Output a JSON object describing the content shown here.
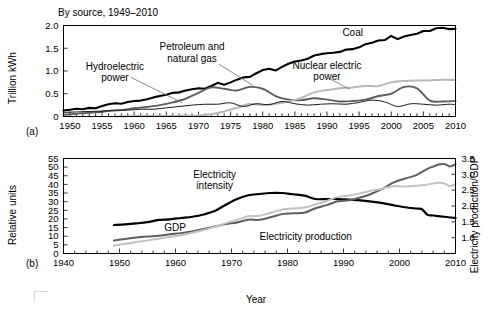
{
  "figure": {
    "panel_a_tag": "(a)",
    "panel_b_tag": "(b)"
  },
  "chart_data": [
    {
      "type": "line",
      "panel": "(a)",
      "title": "By source, 1949–2010",
      "xlabel": "",
      "ylabel": "Trillion kWh",
      "xlim": [
        1949,
        2010
      ],
      "ylim": [
        0,
        2.0
      ],
      "yticks": [
        "0",
        "0.5",
        "1.0",
        "1.5",
        "2.0"
      ],
      "ytick_values": [
        0,
        0.5,
        1.0,
        1.5,
        2.0
      ],
      "xticks": [
        "1950",
        "1955",
        "1960",
        "1965",
        "1970",
        "1975",
        "1980",
        "1985",
        "1990",
        "1995",
        "2000",
        "2005",
        "2010"
      ],
      "xtick_values": [
        1950,
        1955,
        1960,
        1965,
        1970,
        1975,
        1980,
        1985,
        1990,
        1995,
        2000,
        2005,
        2010
      ],
      "minor_tick_step": 1,
      "grid": false,
      "legend": "inline-annotations",
      "annotations": [
        {
          "text": "Coal",
          "x": 1994,
          "y": 1.78
        },
        {
          "text": "Petroleum and\nnatural gas",
          "x": 1969,
          "y": 1.46
        },
        {
          "text": "Hydroelectric\npower",
          "x": 1957,
          "y": 1.03
        },
        {
          "text": "Nuclear electric\npower",
          "x": 1990,
          "y": 1.05
        }
      ],
      "series": [
        {
          "name": "Coal",
          "color": "#000000",
          "width": 2.1,
          "x": [
            1949,
            1950,
            1951,
            1952,
            1953,
            1954,
            1955,
            1956,
            1957,
            1958,
            1959,
            1960,
            1961,
            1962,
            1963,
            1964,
            1965,
            1966,
            1967,
            1968,
            1969,
            1970,
            1971,
            1972,
            1973,
            1974,
            1975,
            1976,
            1977,
            1978,
            1979,
            1980,
            1981,
            1982,
            1983,
            1984,
            1985,
            1986,
            1987,
            1988,
            1989,
            1990,
            1991,
            1992,
            1993,
            1994,
            1995,
            1996,
            1997,
            1998,
            1999,
            2000,
            2001,
            2002,
            2003,
            2004,
            2005,
            2006,
            2007,
            2008,
            2009,
            2010
          ],
          "y": [
            0.13,
            0.15,
            0.17,
            0.16,
            0.19,
            0.18,
            0.23,
            0.27,
            0.29,
            0.28,
            0.32,
            0.34,
            0.35,
            0.38,
            0.42,
            0.45,
            0.48,
            0.52,
            0.53,
            0.57,
            0.6,
            0.62,
            0.61,
            0.67,
            0.74,
            0.7,
            0.75,
            0.81,
            0.86,
            0.87,
            0.95,
            1.02,
            1.05,
            1.01,
            1.09,
            1.16,
            1.21,
            1.23,
            1.27,
            1.34,
            1.37,
            1.39,
            1.4,
            1.42,
            1.47,
            1.48,
            1.52,
            1.59,
            1.62,
            1.67,
            1.68,
            1.77,
            1.7,
            1.76,
            1.79,
            1.82,
            1.88,
            1.88,
            1.94,
            1.95,
            1.92,
            1.93
          ]
        },
        {
          "name": "Petroleum and natural gas",
          "color": "#5e5e5e",
          "width": 1.9,
          "x": [
            1949,
            1950,
            1952,
            1954,
            1956,
            1958,
            1960,
            1962,
            1964,
            1966,
            1968,
            1970,
            1972,
            1974,
            1976,
            1978,
            1980,
            1982,
            1984,
            1986,
            1988,
            1990,
            1992,
            1994,
            1996,
            1998,
            2000,
            2002,
            2004,
            2006,
            2008,
            2010
          ],
          "y": [
            0.04,
            0.05,
            0.07,
            0.09,
            0.12,
            0.14,
            0.18,
            0.21,
            0.25,
            0.31,
            0.39,
            0.52,
            0.64,
            0.61,
            0.57,
            0.65,
            0.61,
            0.45,
            0.37,
            0.36,
            0.4,
            0.37,
            0.33,
            0.34,
            0.37,
            0.45,
            0.5,
            0.65,
            0.62,
            0.35,
            0.33,
            0.34
          ]
        },
        {
          "name": "Nuclear electric power",
          "color": "#b8b8b8",
          "width": 2.0,
          "x": [
            1957,
            1960,
            1965,
            1968,
            1970,
            1972,
            1974,
            1976,
            1978,
            1980,
            1982,
            1984,
            1986,
            1988,
            1990,
            1992,
            1994,
            1996,
            1998,
            2000,
            2002,
            2004,
            2006,
            2008,
            2010
          ],
          "y": [
            0.0,
            0.01,
            0.01,
            0.02,
            0.02,
            0.05,
            0.11,
            0.19,
            0.28,
            0.25,
            0.28,
            0.33,
            0.41,
            0.53,
            0.58,
            0.62,
            0.64,
            0.67,
            0.67,
            0.75,
            0.78,
            0.79,
            0.79,
            0.81,
            0.8
          ]
        },
        {
          "name": "Hydroelectric power",
          "color": "#1a1a1a",
          "width": 1.0,
          "x": [
            1949,
            1951,
            1953,
            1955,
            1957,
            1959,
            1961,
            1963,
            1965,
            1967,
            1969,
            1971,
            1973,
            1975,
            1977,
            1979,
            1981,
            1983,
            1985,
            1987,
            1989,
            1991,
            1993,
            1995,
            1997,
            1999,
            2001,
            2003,
            2005,
            2007,
            2009,
            2010
          ],
          "y": [
            0.09,
            0.1,
            0.11,
            0.12,
            0.14,
            0.14,
            0.16,
            0.16,
            0.19,
            0.22,
            0.25,
            0.27,
            0.27,
            0.3,
            0.22,
            0.28,
            0.26,
            0.33,
            0.28,
            0.25,
            0.27,
            0.28,
            0.27,
            0.31,
            0.36,
            0.32,
            0.22,
            0.28,
            0.27,
            0.25,
            0.27,
            0.26
          ]
        }
      ]
    },
    {
      "type": "line",
      "panel": "(b)",
      "title": "",
      "xlabel": "Year",
      "ylabel": "Relative units",
      "y2label": "Electricity production/GDP",
      "xlim": [
        1940,
        2010
      ],
      "ylim": [
        0,
        55
      ],
      "y2lim": [
        0.5,
        3.5
      ],
      "yticks": [
        "0",
        "5",
        "10",
        "15",
        "20",
        "25",
        "30",
        "35",
        "40",
        "45",
        "50",
        "55"
      ],
      "ytick_values": [
        0,
        5,
        10,
        15,
        20,
        25,
        30,
        35,
        40,
        45,
        50,
        55
      ],
      "y2ticks": [
        "1.0",
        "1.5",
        "2.0",
        "2.5",
        "3.0",
        "3.5"
      ],
      "y2tick_values": [
        1.0,
        1.5,
        2.0,
        2.5,
        3.0,
        3.5
      ],
      "xticks": [
        "1940",
        "1950",
        "1960",
        "1970",
        "1980",
        "1990",
        "2000",
        "2010"
      ],
      "xtick_values": [
        1940,
        1950,
        1960,
        1970,
        1980,
        1990,
        2000,
        2010
      ],
      "minor_tick_step": 2,
      "grid": false,
      "legend": "inline-annotations",
      "annotations": [
        {
          "text": "Electricity\nintensity",
          "x": 1967,
          "y": 44
        },
        {
          "text": "GDP",
          "x": 1958,
          "y": 13
        },
        {
          "text": "Electricity production",
          "x": 1975,
          "y": 8
        }
      ],
      "series": [
        {
          "name": "Electricity intensity",
          "axis": "right",
          "color": "#000000",
          "width": 2.2,
          "x": [
            1949,
            1951,
            1953,
            1955,
            1957,
            1959,
            1961,
            1963,
            1965,
            1967,
            1969,
            1971,
            1973,
            1975,
            1977,
            1979,
            1981,
            1983,
            1985,
            1987,
            1989,
            1991,
            1993,
            1995,
            1997,
            1999,
            2001,
            2003,
            2004,
            2005,
            2006,
            2008,
            2010
          ],
          "y": [
            1.4,
            1.42,
            1.45,
            1.49,
            1.56,
            1.58,
            1.62,
            1.66,
            1.73,
            1.84,
            2.04,
            2.22,
            2.34,
            2.38,
            2.41,
            2.41,
            2.37,
            2.33,
            2.22,
            2.22,
            2.22,
            2.2,
            2.18,
            2.14,
            2.09,
            2.02,
            1.96,
            1.92,
            1.9,
            1.72,
            1.7,
            1.66,
            1.62
          ]
        },
        {
          "name": "GDP",
          "axis": "left",
          "color": "#5e5e5e",
          "width": 2.0,
          "x": [
            1949,
            1951,
            1953,
            1955,
            1957,
            1959,
            1961,
            1963,
            1965,
            1967,
            1969,
            1971,
            1973,
            1975,
            1977,
            1979,
            1981,
            1983,
            1985,
            1987,
            1989,
            1991,
            1993,
            1995,
            1997,
            1999,
            2001,
            2003,
            2005,
            2006,
            2007,
            2008,
            2009,
            2010
          ],
          "y": [
            7.5,
            8.4,
            9.2,
            9.8,
            10.3,
            11.1,
            11.8,
            12.8,
            14.2,
            15.6,
            17.0,
            18.0,
            19.6,
            19.5,
            21.0,
            22.8,
            23.3,
            23.6,
            26.2,
            28.0,
            30.2,
            30.8,
            32.4,
            34.6,
            37.6,
            41.2,
            43.4,
            45.4,
            49.0,
            50.3,
            51.5,
            51.8,
            50.4,
            51.6
          ]
        },
        {
          "name": "Electricity production",
          "axis": "left",
          "color": "#c2c2c2",
          "width": 2.0,
          "x": [
            1949,
            1951,
            1953,
            1955,
            1957,
            1959,
            1961,
            1963,
            1965,
            1967,
            1969,
            1971,
            1973,
            1975,
            1977,
            1979,
            1981,
            1983,
            1985,
            1987,
            1989,
            1991,
            1993,
            1995,
            1997,
            1999,
            2001,
            2003,
            2005,
            2007,
            2008,
            2009,
            2010
          ],
          "y": [
            4.6,
            5.6,
            6.6,
            7.6,
            8.6,
            9.6,
            10.6,
            12.0,
            13.6,
            15.4,
            17.6,
            19.4,
            21.6,
            21.8,
            23.6,
            25.4,
            26.0,
            26.6,
            28.4,
            30.4,
            32.8,
            33.6,
            34.8,
            36.4,
            37.6,
            39.0,
            38.8,
            39.2,
            40.0,
            41.0,
            40.6,
            39.0,
            40.2
          ]
        }
      ]
    }
  ]
}
